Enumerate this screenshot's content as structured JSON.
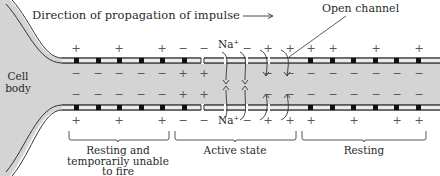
{
  "diagram": {
    "title_arrow_label": "Direction of propagation of impulse",
    "open_channel_label": "Open channel",
    "cell_body_label_line1": "Cell",
    "cell_body_label_line2": "body",
    "ion_label": "Na⁺",
    "regions": [
      {
        "label_lines": [
          "Resting and",
          "temporarily unable",
          "to fire"
        ]
      },
      {
        "label_lines": [
          "Active state"
        ]
      },
      {
        "label_lines": [
          "Resting"
        ]
      }
    ],
    "signs": {
      "top_outside": [
        "+",
        "+",
        "+",
        "−",
        "−",
        "−",
        "+",
        "+",
        "+",
        "+",
        "+",
        "+"
      ],
      "top_inside": [
        "−",
        "−",
        "−",
        "−",
        "−",
        "+",
        "+",
        "+",
        "−",
        "−",
        "−",
        "−",
        "−",
        "−",
        "−",
        "−"
      ],
      "bottom_inside": [
        "−",
        "−",
        "−",
        "−",
        "−",
        "+",
        "+",
        "+",
        "−",
        "−",
        "−",
        "−",
        "−",
        "−",
        "−",
        "−"
      ],
      "bottom_outside": [
        "+",
        "+",
        "+",
        "−",
        "−",
        "−",
        "+",
        "+",
        "+",
        "+",
        "+",
        "+"
      ]
    },
    "colors": {
      "axoplasm": "#d4d4d4",
      "membrane_fill": "#e8e8e8",
      "membrane_stroke": "#333333",
      "node": "#111111"
    }
  }
}
